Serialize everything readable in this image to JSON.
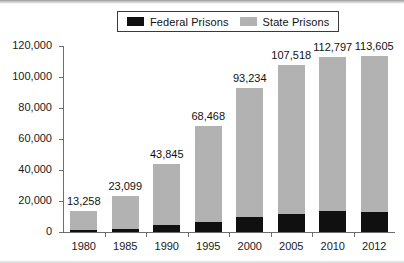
{
  "chart_data": {
    "type": "bar",
    "subtype": "stacked-bar",
    "title": "",
    "xlabel": "",
    "ylabel": "",
    "ylim": [
      0,
      120000
    ],
    "ytick_labels": [
      "0",
      "20,000",
      "40,000",
      "60,000",
      "80,000",
      "100,000",
      "120,000"
    ],
    "ytick_values": [
      0,
      20000,
      40000,
      60000,
      80000,
      100000,
      120000
    ],
    "grid": false,
    "legend_position": "top-center",
    "categories": [
      "1980",
      "1985",
      "1990",
      "1995",
      "2000",
      "2005",
      "2010",
      "2012"
    ],
    "series": [
      {
        "name": "Federal Prisons",
        "color": "#101010",
        "values": [
          1500,
          2100,
          4800,
          6700,
          9500,
          11600,
          13800,
          13100
        ]
      },
      {
        "name": "State Prisons",
        "color": "#b2b2b2",
        "values": [
          11758,
          20999,
          39045,
          61768,
          83734,
          95918,
          98997,
          100505
        ]
      }
    ],
    "totals": [
      13258,
      23099,
      43845,
      68468,
      93234,
      107518,
      112797,
      113605
    ],
    "total_labels": [
      "13,258",
      "23,099",
      "43,845",
      "68,468",
      "93,234",
      "107,518",
      "112,797",
      "113,605"
    ]
  },
  "legend": {
    "entries": [
      {
        "label": "Federal Prisons",
        "swatch": "legend-swatch-federal",
        "color": "#101010"
      },
      {
        "label": "State Prisons",
        "swatch": "legend-swatch-state",
        "color": "#b2b2b2"
      }
    ]
  },
  "colors": {
    "federal": "#101010",
    "state": "#b2b2b2",
    "axis": "#6e6e6e",
    "text": "#111111",
    "background": "#ffffff"
  }
}
